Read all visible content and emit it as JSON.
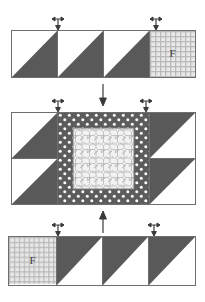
{
  "diagram": {
    "type": "quilt-block-piecing-diagram",
    "rows": [
      {
        "id": "row-top",
        "name": "top-row",
        "units": [
          {
            "name": "half-square-triangle-unit",
            "fabric": "solid-dark-gray",
            "orientation": "triangle-lower-right",
            "label": ""
          },
          {
            "name": "half-square-triangle-unit",
            "fabric": "solid-dark-gray",
            "orientation": "triangle-lower-right",
            "label": ""
          },
          {
            "name": "half-square-triangle-unit",
            "fabric": "solid-dark-gray",
            "orientation": "triangle-lower-right",
            "label": ""
          },
          {
            "name": "corner-square-unit",
            "fabric": "grid-plaid-light",
            "orientation": "square",
            "label": "F"
          }
        ]
      },
      {
        "id": "row-middle",
        "name": "middle-row",
        "units": [
          {
            "name": "half-square-triangle-unit",
            "fabric": "solid-dark-gray",
            "orientation": "triangle-lower-right",
            "label": ""
          },
          {
            "name": "half-square-triangle-unit",
            "fabric": "solid-dark-gray",
            "orientation": "triangle-lower-right",
            "label": ""
          },
          {
            "name": "center-block",
            "fabric": "dot-border-with-floral-center",
            "orientation": "square",
            "label": ""
          },
          {
            "name": "half-square-triangle-unit",
            "fabric": "solid-dark-gray",
            "orientation": "triangle-upper-left",
            "label": ""
          },
          {
            "name": "half-square-triangle-unit",
            "fabric": "solid-dark-gray",
            "orientation": "triangle-upper-left",
            "label": ""
          }
        ]
      },
      {
        "id": "row-bottom",
        "name": "bottom-row",
        "units": [
          {
            "name": "corner-square-unit",
            "fabric": "grid-plaid-light",
            "orientation": "square",
            "label": "F"
          },
          {
            "name": "half-square-triangle-unit",
            "fabric": "solid-dark-gray",
            "orientation": "triangle-upper-left",
            "label": ""
          },
          {
            "name": "half-square-triangle-unit",
            "fabric": "solid-dark-gray",
            "orientation": "triangle-upper-left",
            "label": ""
          },
          {
            "name": "half-square-triangle-unit",
            "fabric": "solid-dark-gray",
            "orientation": "triangle-upper-left",
            "label": ""
          }
        ]
      }
    ],
    "arrows": [
      {
        "name": "seam-marker-arrow-top-left",
        "direction": "left-right",
        "target": "top-row-seam-1"
      },
      {
        "name": "seam-marker-arrow-top-right",
        "direction": "left-right",
        "target": "top-row-seam-3"
      },
      {
        "name": "assembly-arrow-top-to-middle",
        "direction": "down",
        "target": "join-top-row"
      },
      {
        "name": "seam-marker-arrow-middle-left",
        "direction": "left-right",
        "target": "middle-row-seam-left"
      },
      {
        "name": "seam-marker-arrow-middle-right",
        "direction": "left-right",
        "target": "middle-row-seam-right"
      },
      {
        "name": "assembly-arrow-bottom-to-middle",
        "direction": "up",
        "target": "join-bottom-row"
      },
      {
        "name": "seam-marker-arrow-bottom-left",
        "direction": "left-right",
        "target": "bottom-row-seam-1"
      },
      {
        "name": "seam-marker-arrow-bottom-right",
        "direction": "left-right",
        "target": "bottom-row-seam-3"
      }
    ],
    "colors": {
      "solid_dark_gray": "#595959",
      "outline_gray": "#6e6e6e",
      "background_white": "#ffffff",
      "plaid_light": "#e8e8e8",
      "plaid_line": "#b5b5b5",
      "dot_fabric_bg": "#5c5c5c",
      "dot_fabric_dot": "#ffffff",
      "floral_center_bg": "#efefef",
      "floral_center_mark": "#8e8e8e",
      "arrow_color": "#3a3a3a"
    },
    "labels": {
      "corner_square_letter": "F"
    }
  }
}
